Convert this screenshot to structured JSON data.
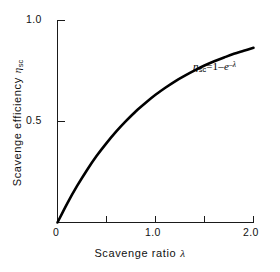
{
  "chart_data": {
    "type": "line",
    "title": "",
    "xlabel": "Scavenge ratio λ",
    "ylabel": "Scavenge efficiency ηsc",
    "xlim": [
      0,
      2.0
    ],
    "ylim": [
      0,
      1.0
    ],
    "grid": false,
    "legend": null,
    "equation": "ηsc = 1 - e^(-λ)",
    "x_ticks": [
      0,
      0.5,
      1.0,
      1.5,
      2.0
    ],
    "x_tick_labels": [
      "0",
      "",
      "1.0",
      "",
      "2.0"
    ],
    "y_ticks": [
      0,
      0.5,
      1.0
    ],
    "y_tick_labels": [
      "",
      "0.5",
      "1.0"
    ],
    "series": [
      {
        "name": "ηsc = 1 - e^(-λ)",
        "x": [
          0,
          0.1,
          0.2,
          0.3,
          0.4,
          0.5,
          0.6,
          0.7,
          0.8,
          0.9,
          1.0,
          1.1,
          1.2,
          1.3,
          1.4,
          1.5,
          1.6,
          1.7,
          1.8,
          1.9,
          2.0
        ],
        "values": [
          0.0,
          0.095,
          0.181,
          0.259,
          0.33,
          0.393,
          0.451,
          0.503,
          0.551,
          0.593,
          0.632,
          0.667,
          0.699,
          0.727,
          0.753,
          0.777,
          0.798,
          0.817,
          0.835,
          0.85,
          0.865
        ]
      }
    ]
  },
  "axes": {
    "x_labels": {
      "zero": "0",
      "one": "1.0",
      "two": "2.0"
    },
    "y_labels": {
      "half": "0.5",
      "one": "1.0"
    },
    "x_axis_title_text": "Scavenge ratio",
    "x_axis_title_symbol": "λ",
    "y_axis_title_text": "Scavenge efficiency",
    "y_axis_title_symbol": "η",
    "y_axis_title_subscript": "sc"
  },
  "annotation": {
    "symbol": "η",
    "subscript": "sc",
    "equals": "=",
    "one_minus": "1–",
    "e": "e",
    "exponent": "–λ"
  },
  "colors": {
    "background": "#ffffff",
    "curve": "#000000",
    "axis": "#1a1a1a",
    "text": "#111111"
  }
}
